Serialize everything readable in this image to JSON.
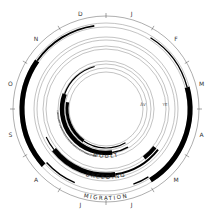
{
  "diagram": {
    "type": "annual-cycle-circular-diagram",
    "center": [
      106,
      109
    ],
    "months": [
      "J",
      "F",
      "M",
      "A",
      "M",
      "J",
      "J",
      "A",
      "S",
      "O",
      "N",
      "D"
    ],
    "month_label_radius": 99,
    "scale_radius": 93,
    "rings": [
      {
        "name": "migration",
        "label": "MIGRATION",
        "label_radius": 87,
        "guide_radii": [
          86,
          82
        ],
        "bars": [
          {
            "start_deg": 305,
            "end_deg": 352,
            "radius": 84,
            "width": 1.8,
            "comment": "thin arc late Nov-Dec"
          },
          {
            "start_deg": 228,
            "end_deg": 305,
            "radius": 84,
            "width": 5,
            "comment": "thick arc Sep-Nov"
          },
          {
            "start_deg": 203,
            "end_deg": 228,
            "radius": 80,
            "width": 1.4
          },
          {
            "start_deg": 32,
            "end_deg": 75,
            "radius": 84,
            "width": 1.4
          },
          {
            "start_deg": 75,
            "end_deg": 148,
            "radius": 84,
            "width": 5
          },
          {
            "start_deg": 148,
            "end_deg": 160,
            "radius": 80,
            "width": 1.4
          }
        ]
      },
      {
        "name": "breeding",
        "label": "BREEDING",
        "label_radius": 66,
        "guide_radii": [
          72,
          69,
          63,
          60
        ],
        "bars": [
          {
            "start_deg": 172,
            "end_deg": 232,
            "radius": 66,
            "width": 5
          },
          {
            "start_deg": 128,
            "end_deg": 172,
            "radius": 66,
            "width": 2
          },
          {
            "start_deg": 128,
            "end_deg": 142,
            "radius": 62,
            "width": 4
          },
          {
            "start_deg": 232,
            "end_deg": 245,
            "radius": 66,
            "width": 1.2
          }
        ]
      },
      {
        "name": "moult",
        "label": "MOULT",
        "label_radius": 45,
        "guide_radii": [
          48,
          45,
          41,
          37
        ],
        "bars": [
          {
            "start_deg": 172,
            "end_deg": 290,
            "radius": 44,
            "width": 4.5
          },
          {
            "start_deg": 290,
            "end_deg": 345,
            "radius": 44,
            "width": 1.2
          },
          {
            "start_deg": 150,
            "end_deg": 172,
            "radius": 44,
            "width": 1.6
          },
          {
            "start_deg": 215,
            "end_deg": 280,
            "radius": 39,
            "width": 3
          },
          {
            "start_deg": 150,
            "end_deg": 215,
            "radius": 39,
            "width": 1.2
          },
          {
            "start_deg": 192,
            "end_deg": 268,
            "radius": 48.5,
            "width": 1.4,
            "dotted": true
          }
        ]
      }
    ],
    "inner_labels": [
      {
        "text": "ÅV",
        "x": 143,
        "y": 104
      },
      {
        "text": "YE",
        "x": 165,
        "y": 104
      }
    ]
  }
}
